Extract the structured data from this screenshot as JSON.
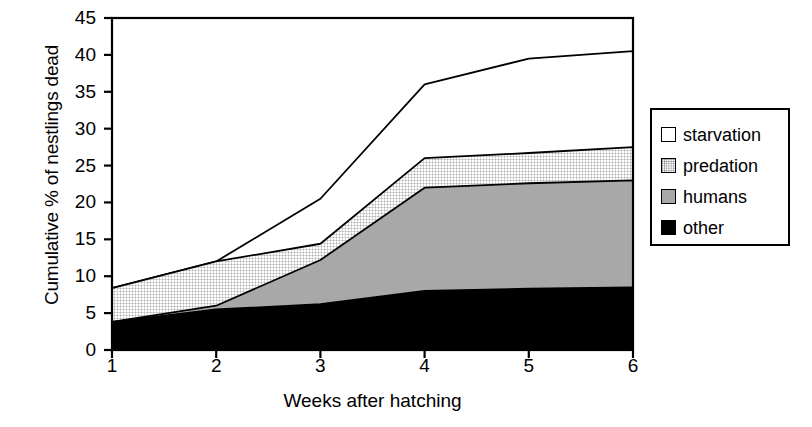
{
  "chart_data": {
    "type": "area",
    "title": "",
    "xlabel": "Weeks after hatching",
    "ylabel": "Cumulative % of nestlings dead",
    "x": [
      1,
      2,
      3,
      4,
      5,
      6
    ],
    "xtick_labels": [
      "1",
      "2",
      "3",
      "4",
      "5",
      "6"
    ],
    "ytick_labels": [
      "0",
      "5",
      "10",
      "15",
      "20",
      "25",
      "30",
      "35",
      "40",
      "45"
    ],
    "ytick_values": [
      0,
      5,
      10,
      15,
      20,
      25,
      30,
      35,
      40,
      45
    ],
    "xlim": [
      1,
      6
    ],
    "ylim": [
      0,
      45
    ],
    "grid": false,
    "stacked": true,
    "legend_position": "right",
    "series": [
      {
        "name": "other",
        "color": "#000000",
        "fill": "solid",
        "values": [
          3.8,
          5.5,
          6.2,
          8.0,
          8.3,
          8.5
        ],
        "cumulative": [
          3.8,
          5.5,
          6.2,
          8.0,
          8.3,
          8.5
        ]
      },
      {
        "name": "humans",
        "color": "#a8a8a8",
        "fill": "solid",
        "values": [
          0.0,
          0.5,
          6.0,
          14.0,
          14.3,
          14.5
        ],
        "cumulative": [
          3.8,
          6.0,
          12.2,
          22.0,
          22.6,
          23.0
        ]
      },
      {
        "name": "predation",
        "color": "#ffffff",
        "fill": "stipple",
        "values": [
          4.6,
          6.0,
          2.2,
          4.0,
          4.1,
          4.5
        ],
        "cumulative": [
          8.4,
          12.0,
          14.4,
          26.0,
          26.7,
          27.5
        ]
      },
      {
        "name": "starvation",
        "color": "#ffffff",
        "fill": "blank",
        "values": [
          0.0,
          0.0,
          6.1,
          10.0,
          12.8,
          13.0
        ],
        "cumulative": [
          8.4,
          12.0,
          20.5,
          36.0,
          39.5,
          40.5
        ]
      }
    ]
  },
  "legend": {
    "items": [
      {
        "label": "starvation",
        "swatch": "white-square-icon"
      },
      {
        "label": "predation",
        "swatch": "stippled-square-icon"
      },
      {
        "label": "humans",
        "swatch": "gray-square-icon"
      },
      {
        "label": "other",
        "swatch": "black-square-icon"
      }
    ]
  },
  "colors": {
    "axis": "#000000",
    "other": "#000000",
    "humans": "#a8a8a8",
    "predation": "#ffffff",
    "starvation": "#ffffff",
    "background": "#ffffff"
  }
}
